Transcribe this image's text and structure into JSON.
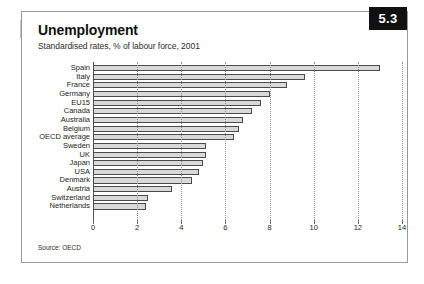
{
  "page": {
    "badge_number": "5.3",
    "title": "Unemployment",
    "subtitle": "Standardised rates, % of labour force, 2001",
    "source": "Source: OECD"
  },
  "chart_data": {
    "type": "bar",
    "orientation": "horizontal",
    "title": "Unemployment",
    "subtitle": "Standardised rates, % of labour force, 2001",
    "xlabel": "",
    "ylabel": "",
    "xlim": [
      0,
      14
    ],
    "xticks": [
      0,
      2,
      4,
      6,
      8,
      10,
      12,
      14
    ],
    "grid": "vertical-dotted",
    "legend": "none",
    "bar_color": "#d9d9d9",
    "bar_edge_color": "#4a4a4a",
    "categories": [
      "Spain",
      "Italy",
      "France",
      "Germany",
      "EU15",
      "Canada",
      "Australia",
      "Belgium",
      "OECD average",
      "Sweden",
      "UK",
      "Japan",
      "USA",
      "Denmark",
      "Austria",
      "Switzerland",
      "Netherlands"
    ],
    "values": [
      13.0,
      9.6,
      8.8,
      8.0,
      7.6,
      7.2,
      6.8,
      6.6,
      6.4,
      5.1,
      5.1,
      5.0,
      4.8,
      4.5,
      3.6,
      2.5,
      2.4
    ]
  }
}
